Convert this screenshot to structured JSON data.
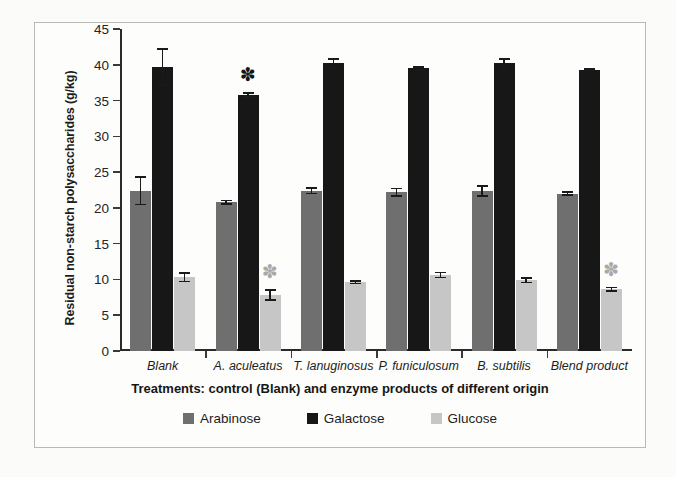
{
  "figure": {
    "y_axis_title": "Residual non-starch polysaccharides (g/kg)",
    "x_axis_title": "Treatments: control  (Blank) and enzyme products of different origin"
  },
  "chart_data": {
    "type": "bar",
    "title": "",
    "xlabel": "Treatments: control  (Blank) and enzyme products of different origin",
    "ylabel": "Residual non-starch polysaccharides (g/kg)",
    "ylim": [
      0,
      45
    ],
    "ytick_labels": [
      "0",
      "5",
      "10",
      "15",
      "20",
      "25",
      "30",
      "35",
      "40",
      "45"
    ],
    "yticks": [
      0,
      5,
      10,
      15,
      20,
      25,
      30,
      35,
      40,
      45
    ],
    "grid": false,
    "legend_position": "bottom",
    "categories": [
      "Blank",
      "A. aculeatus",
      "T. lanuginosus",
      "P. funiculosum",
      "B. subtilis",
      "Blend product"
    ],
    "series": [
      {
        "name": "Arabinose",
        "color": "#6f6f6f",
        "values": [
          22.4,
          20.8,
          22.4,
          22.2,
          22.4,
          22.0
        ],
        "errors": [
          1.9,
          0.25,
          0.4,
          0.5,
          0.7,
          0.2
        ],
        "significance": [
          false,
          false,
          false,
          false,
          false,
          false
        ]
      },
      {
        "name": "Galactose",
        "color": "#171717",
        "values": [
          39.7,
          35.8,
          40.2,
          39.5,
          40.2,
          39.3
        ],
        "errors": [
          2.5,
          0.3,
          0.6,
          0.2,
          0.6,
          0.1
        ],
        "significance": [
          false,
          true,
          false,
          false,
          false,
          false
        ]
      },
      {
        "name": "Glucose",
        "color": "#c6c6c6",
        "values": [
          10.3,
          7.8,
          9.6,
          10.6,
          9.9,
          8.6
        ],
        "errors": [
          0.6,
          0.7,
          0.15,
          0.35,
          0.3,
          0.25
        ],
        "significance": [
          false,
          true,
          false,
          false,
          false,
          true
        ]
      }
    ],
    "annotations": [
      {
        "label": "*",
        "series": "Galactose",
        "category": "A. aculeatus",
        "meaning": "significant-difference"
      },
      {
        "label": "*",
        "series": "Glucose",
        "category": "A. aculeatus",
        "meaning": "significant-difference"
      },
      {
        "label": "*",
        "series": "Glucose",
        "category": "Blend product",
        "meaning": "significant-difference"
      }
    ]
  },
  "legend": {
    "items": [
      {
        "label": "Arabinose",
        "color": "#6f6f6f"
      },
      {
        "label": "Galactose",
        "color": "#171717"
      },
      {
        "label": "Glucose",
        "color": "#c6c6c6"
      }
    ]
  }
}
